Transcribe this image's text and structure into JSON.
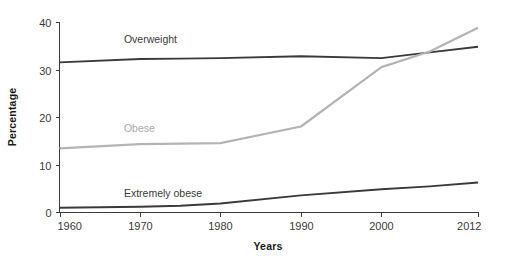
{
  "chart_data": {
    "type": "line",
    "title": "",
    "xlabel": "Years",
    "ylabel": "Percentage",
    "xlim": [
      1960,
      2012
    ],
    "ylim": [
      0,
      40
    ],
    "xticks": [
      1960,
      1970,
      1980,
      1990,
      2000,
      2012
    ],
    "yticks": [
      0,
      10,
      20,
      30,
      40
    ],
    "xtick_labels": [
      "1960",
      "1970",
      "1980",
      "1990",
      "2000",
      "2012"
    ],
    "ytick_labels": [
      "0",
      "10",
      "20",
      "30",
      "40"
    ],
    "grid": false,
    "legend_position": "inline-labels",
    "x": [
      1960,
      1970,
      1975,
      1980,
      1990,
      2000,
      2006,
      2012
    ],
    "series": [
      {
        "name": "Overweight",
        "label": "Overweight",
        "color": "#3a3a3a",
        "values": [
          31.5,
          32.2,
          32.3,
          32.4,
          32.8,
          32.4,
          33.6,
          34.8
        ]
      },
      {
        "name": "Obese",
        "label": "Obese",
        "color": "#b4b4b4",
        "values": [
          13.4,
          14.3,
          14.4,
          14.5,
          18.0,
          30.5,
          33.8,
          38.8
        ]
      },
      {
        "name": "Extremely obese",
        "label": "Extremely obese",
        "color": "#3a3a3a",
        "values": [
          0.9,
          1.1,
          1.3,
          1.8,
          3.5,
          4.8,
          5.4,
          6.2
        ]
      }
    ],
    "annotations": [
      {
        "text": "Overweight",
        "x": 1968,
        "y": 35.6,
        "color": "#3a3a3a"
      },
      {
        "text": "Obese",
        "x": 1968,
        "y": 16.8,
        "color": "#a9a9a9"
      },
      {
        "text": "Extremely obese",
        "x": 1968,
        "y": 3.1,
        "color": "#3a3a3a"
      }
    ]
  },
  "axes": {
    "y_title": "Percentage",
    "x_title": "Years"
  }
}
